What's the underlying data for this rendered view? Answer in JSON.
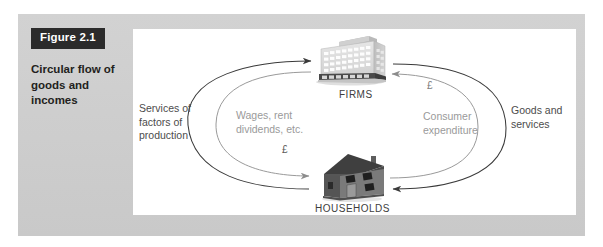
{
  "figure": {
    "number_label": "Figure 2.1",
    "caption": "Circular flow\nof goods and\nincomes"
  },
  "diagram": {
    "nodes": [
      {
        "id": "firms",
        "label": "FIRMS",
        "icon": "office-building-icon"
      },
      {
        "id": "households",
        "label": "HOUSEHOLDS",
        "icon": "house-icon"
      }
    ],
    "flows": [
      {
        "id": "services-of-factors",
        "label": "Services of\nfactors of\nproduction",
        "side": "left",
        "ring": "outer",
        "from": "households",
        "to": "firms"
      },
      {
        "id": "wages-rent-dividends",
        "label": "Wages, rent\ndividends, etc.",
        "side": "left",
        "ring": "inner",
        "from": "firms",
        "to": "households",
        "money_symbol": "£"
      },
      {
        "id": "goods-and-services",
        "label": "Goods and\nservices",
        "side": "right",
        "ring": "outer",
        "from": "firms",
        "to": "households"
      },
      {
        "id": "consumer-expenditure",
        "label": "Consumer\nexpenditure",
        "side": "right",
        "ring": "inner",
        "from": "households",
        "to": "firms",
        "money_symbol": "£"
      }
    ],
    "money_symbol_left": "£",
    "money_symbol_right": "£"
  },
  "colors": {
    "badge_background": "#2b2b2b",
    "badge_text": "#ffffff",
    "panel_gray": "#cdcdcd",
    "panel_white": "#ffffff",
    "caption_text": "#231f20",
    "outer_label_text": "#4c4c4c",
    "inner_label_text": "#9a9a9a",
    "node_label_text": "#3d3d3d",
    "outer_arrow": "#3a3a3a",
    "inner_arrow": "#8c8c8c",
    "building_fill": "#d8d8d8",
    "house_fill": "#6e6e6e"
  }
}
